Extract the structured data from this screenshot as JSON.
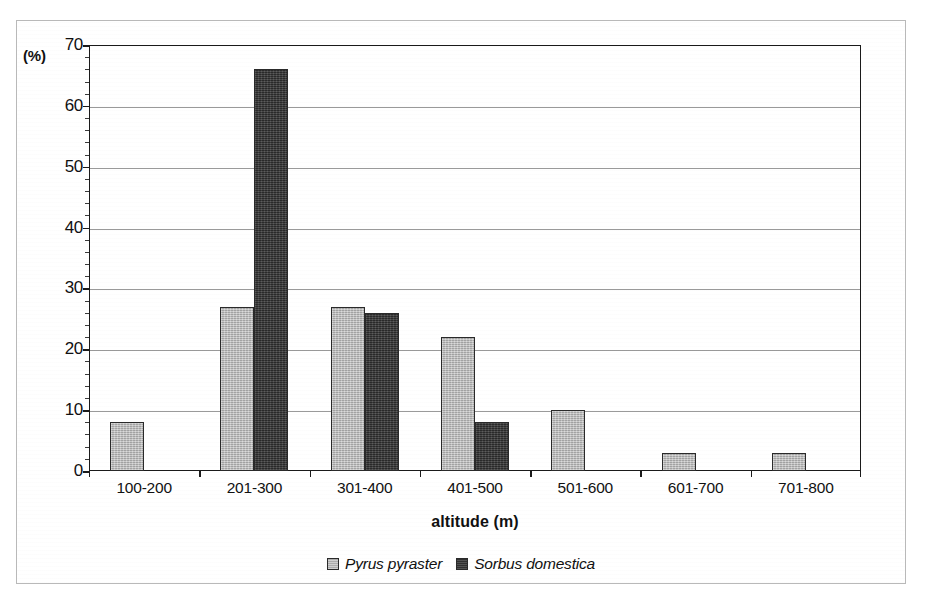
{
  "figure": {
    "y_unit_label": "(%)",
    "x_axis_title": "altitude (m)"
  },
  "chart_data": {
    "type": "bar",
    "title": "",
    "subtitle": "",
    "xlabel": "altitude (m)",
    "ylabel": "(%)",
    "ylim": [
      0,
      70
    ],
    "ytick_values": [
      0,
      10,
      20,
      30,
      40,
      50,
      60,
      70
    ],
    "ytick_labels": [
      "0",
      "10",
      "20",
      "30",
      "40",
      "50",
      "60",
      "70"
    ],
    "y_minor_tick_interval": 2,
    "grid": true,
    "grid_axis": "y",
    "legend_position": "bottom",
    "categories": [
      "100-200",
      "201-300",
      "301-400",
      "401-500",
      "501-600",
      "601-700",
      "701-800"
    ],
    "series": [
      {
        "name": "Pyrus pyraster",
        "color": "#b6b6b6",
        "values": [
          8,
          27,
          27,
          22,
          10,
          3,
          3
        ]
      },
      {
        "name": "Sorbus domestica",
        "color": "#3b3b3b",
        "values": [
          0,
          66,
          26,
          8,
          0,
          0,
          0
        ]
      }
    ]
  }
}
